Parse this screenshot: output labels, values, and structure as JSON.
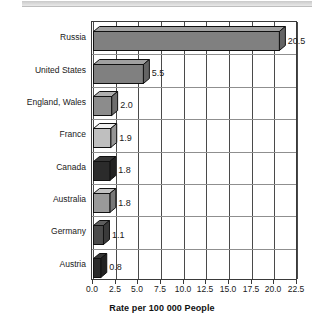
{
  "chart_data": {
    "type": "bar",
    "orientation": "horizontal",
    "title": "",
    "subtitle": "",
    "xlabel": "Rate per 100 000 People",
    "ylabel": "",
    "categories": [
      "Russia",
      "United States",
      "England, Wales",
      "France",
      "Canada",
      "Australia",
      "Germany",
      "Austria"
    ],
    "values": [
      20.5,
      5.5,
      2.0,
      1.9,
      1.8,
      1.8,
      1.1,
      0.8
    ],
    "value_labels": [
      "20.5",
      "5.5",
      "2.0",
      "1.9",
      "1.8",
      "1.8",
      "1.1",
      "0.8"
    ],
    "bar_colors": [
      "#808080",
      "#808080",
      "#8c8c8c",
      "#bfbfbf",
      "#2b2b2b",
      "#9a9a9a",
      "#4a4a4a",
      "#2b2b2b"
    ],
    "xlim": [
      0.0,
      22.5
    ],
    "xticks": [
      0.0,
      2.5,
      5.0,
      7.5,
      10.0,
      12.5,
      15.0,
      17.5,
      20.0,
      22.5
    ],
    "xtick_labels": [
      "0.0",
      "2.5",
      "5.0",
      "7.5",
      "10.0",
      "12.5",
      "15.0",
      "17.5",
      "20.0",
      "22.5"
    ],
    "grid": true,
    "grid_axis": "both",
    "legend": false,
    "legend_position": "none",
    "style_3d": true
  },
  "axis": {
    "x_title": "Rate per 100 000 People"
  }
}
